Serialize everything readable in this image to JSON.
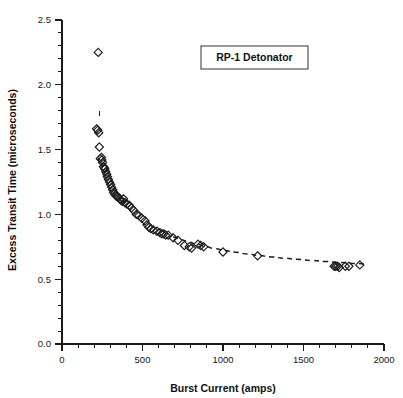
{
  "chart_data": {
    "type": "scatter",
    "title": "",
    "annotation": "RP-1 Detonator",
    "xlabel": "Burst Current (amps)",
    "ylabel": "Excess Transit Time (microseconds)",
    "xlim": [
      0,
      2000
    ],
    "ylim": [
      0.0,
      2.5
    ],
    "xticks": [
      0,
      500,
      1000,
      1500,
      2000
    ],
    "xtick_labels": [
      "0",
      "500",
      "1000",
      "1500",
      "2000"
    ],
    "xminor_step": 100,
    "yticks": [
      0.0,
      0.5,
      1.0,
      1.5,
      2.0,
      2.5
    ],
    "ytick_labels": [
      "0.0",
      "0.5",
      "1.0",
      "1.5",
      "2.0",
      "2.5"
    ],
    "yminor_step": 0.1,
    "grid": false,
    "legend": false,
    "marker": "open-diamond",
    "marker_color": "#1b1b1b",
    "series": [
      {
        "name": "RP-1 Detonator measurements",
        "x": [
          225,
          215,
          222,
          228,
          232,
          238,
          245,
          248,
          252,
          258,
          262,
          266,
          272,
          278,
          282,
          288,
          295,
          302,
          308,
          315,
          320,
          326,
          332,
          338,
          344,
          350,
          358,
          366,
          374,
          382,
          392,
          404,
          418,
          432,
          446,
          462,
          478,
          496,
          516,
          528,
          540,
          552,
          568,
          590,
          608,
          620,
          632,
          644,
          660,
          690,
          720,
          760,
          790,
          805,
          845,
          862,
          880,
          1000,
          1215,
          1690,
          1700,
          1712,
          1722,
          1760,
          1782,
          1850
        ],
        "y": [
          2.25,
          1.66,
          1.65,
          1.63,
          1.52,
          1.43,
          1.44,
          1.42,
          1.4,
          1.37,
          1.36,
          1.35,
          1.33,
          1.31,
          1.29,
          1.27,
          1.25,
          1.23,
          1.21,
          1.19,
          1.17,
          1.16,
          1.15,
          1.14,
          1.14,
          1.13,
          1.12,
          1.11,
          1.1,
          1.12,
          1.09,
          1.08,
          1.07,
          1.05,
          1.03,
          1.0,
          0.99,
          0.97,
          0.95,
          0.92,
          0.9,
          0.89,
          0.88,
          0.87,
          0.86,
          0.85,
          0.85,
          0.84,
          0.84,
          0.82,
          0.8,
          0.76,
          0.75,
          0.74,
          0.77,
          0.76,
          0.75,
          0.71,
          0.68,
          0.6,
          0.6,
          0.6,
          0.59,
          0.6,
          0.6,
          0.61
        ]
      }
    ],
    "fit_curve": {
      "name": "fitted trend",
      "style": "dashed",
      "x": [
        690,
        740,
        790,
        840,
        890,
        950,
        1010,
        1080,
        1150,
        1220,
        1300,
        1380,
        1460,
        1550,
        1640,
        1730,
        1820,
        1900
      ],
      "y": [
        0.825,
        0.805,
        0.785,
        0.768,
        0.752,
        0.736,
        0.722,
        0.708,
        0.695,
        0.684,
        0.672,
        0.662,
        0.653,
        0.644,
        0.636,
        0.628,
        0.621,
        0.616
      ]
    },
    "error_bar": {
      "x": 232,
      "y_top": 1.8,
      "y_bottom": 1.76
    }
  }
}
